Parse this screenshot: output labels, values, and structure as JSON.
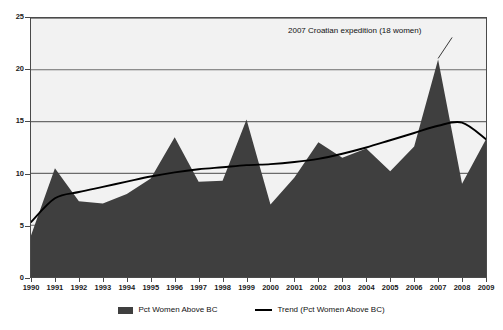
{
  "chart_data": {
    "type": "area",
    "title": "",
    "subtitle": "",
    "xlabel": "",
    "ylabel": "",
    "xlim": [
      1990,
      2009
    ],
    "ylim": [
      0,
      25
    ],
    "grid": true,
    "legend_position": "bottom",
    "categories": [
      "1990",
      "1991",
      "1992",
      "1993",
      "1994",
      "1995",
      "1996",
      "1997",
      "1998",
      "1999",
      "2000",
      "2001",
      "2002",
      "2003",
      "2004",
      "2005",
      "2006",
      "2007",
      "2008",
      "2009"
    ],
    "x_tick_labels": [
      "1990",
      "1991",
      "1992",
      "1993",
      "1994",
      "1995",
      "1996",
      "1997",
      "1998",
      "1999",
      "2000",
      "2001",
      "2002",
      "2003",
      "2004",
      "2005",
      "2006",
      "2007",
      "2008",
      "2009"
    ],
    "y_tick_labels": [
      "0",
      "5",
      "10",
      "15",
      "20",
      "25"
    ],
    "y_ticks": [
      0,
      5,
      10,
      15,
      20,
      25
    ],
    "series": [
      {
        "name": "Pct Women Above BC",
        "type": "area",
        "color": "#3f3f3f",
        "values": [
          4.0,
          10.5,
          7.3,
          7.1,
          8.0,
          9.5,
          13.5,
          9.2,
          9.3,
          15.2,
          7.0,
          9.6,
          13.0,
          11.5,
          12.4,
          10.2,
          12.6,
          21.0,
          9.0,
          13.3
        ]
      },
      {
        "name": "Trend (Pct Women Above BC)",
        "type": "line",
        "color": "#000000",
        "values": [
          5.3,
          7.6,
          8.2,
          8.7,
          9.2,
          9.7,
          10.1,
          10.4,
          10.6,
          10.8,
          10.9,
          11.1,
          11.4,
          11.9,
          12.5,
          13.2,
          13.9,
          14.6,
          14.9,
          13.3
        ]
      }
    ],
    "annotations": [
      {
        "name": "croatian-expedition-note",
        "text": "2007 Croatian expedition (18 women)",
        "target_year": "2007",
        "target_value": 21.0
      }
    ]
  },
  "legend": {
    "items": [
      {
        "label": "Pct Women Above BC",
        "marker": "area-swatch"
      },
      {
        "label": "Trend (Pct Women Above BC)",
        "marker": "line-swatch"
      }
    ]
  },
  "colors": {
    "area_fill": "#3f3f3f",
    "trend_line": "#000000",
    "plot_background": "#f2f2f2",
    "gridline": "#6b6b6b",
    "axis": "#4a4a4a",
    "text": "#111111"
  }
}
